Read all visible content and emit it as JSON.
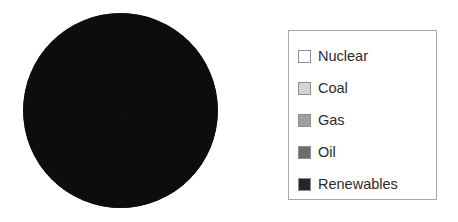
{
  "chart_data": {
    "type": "pie",
    "title": "",
    "categories": [
      "Nuclear",
      "Coal",
      "Gas",
      "Oil",
      "Renewables"
    ],
    "values": [
      20,
      20,
      20,
      20,
      20
    ],
    "colors": [
      "#ffffff",
      "#d4d4d4",
      "#a0a0a0",
      "#6e6e6e",
      "#262626"
    ],
    "rendered_fill": "#0d0d0d",
    "legend_position": "right",
    "grid": false,
    "xlabel": "",
    "ylabel": ""
  },
  "legend": {
    "items": [
      {
        "label": "Nuclear",
        "swatch_color": "#ffffff",
        "swatch_icon": "square-swatch-icon"
      },
      {
        "label": "Coal",
        "swatch_color": "#d4d4d4",
        "swatch_icon": "square-swatch-icon"
      },
      {
        "label": "Gas",
        "swatch_color": "#a0a0a0",
        "swatch_icon": "square-swatch-icon"
      },
      {
        "label": "Oil",
        "swatch_color": "#6e6e6e",
        "swatch_icon": "square-swatch-icon"
      },
      {
        "label": "Renewables",
        "swatch_color": "#262626",
        "swatch_icon": "square-swatch-icon"
      }
    ]
  },
  "pie": {
    "name": "pie-chart-circle"
  }
}
